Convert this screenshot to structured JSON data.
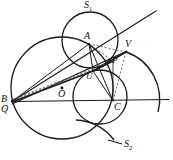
{
  "figure": {
    "kind": "geometry-diagram",
    "width": 173,
    "height": 160,
    "background": "#ffffff",
    "stroke_color": "#1a1a1a",
    "dashed_color": "#555555"
  },
  "labels": {
    "s1": "S",
    "s1_sub": "1",
    "s2": "S",
    "s2_sub": "2",
    "a": "A",
    "b": "B",
    "c": "C",
    "o": "O",
    "p": "P",
    "q": "Q",
    "u": "U",
    "v": "V"
  },
  "points": {
    "A": {
      "x": 89,
      "y": 44,
      "label": "A",
      "label_x": 84,
      "label_y": 33
    },
    "B": {
      "x": 12,
      "y": 101,
      "label": "B",
      "label_x": 2,
      "label_y": 95
    },
    "C": {
      "x": 113,
      "y": 101,
      "label": "C",
      "label_x": 115,
      "label_y": 104
    },
    "O": {
      "x": 62,
      "y": 88,
      "label": "O",
      "label_x": 60,
      "label_y": 91
    },
    "P": {
      "x": 113,
      "y": 61,
      "label": "P",
      "label_x": 111,
      "label_y": 58
    },
    "Q": {
      "x": 12,
      "y": 104,
      "label": "Q",
      "label_x": 2,
      "label_y": 106
    },
    "U": {
      "x": 93,
      "y": 71,
      "label": "U",
      "label_x": 88,
      "label_y": 74
    },
    "V": {
      "x": 126,
      "y": 52,
      "label": "V",
      "label_x": 125,
      "label_y": 41
    },
    "S1": {
      "label_x": 85,
      "label_y": 1
    },
    "S2": {
      "label_x": 126,
      "label_y": 140
    }
  },
  "circles": [
    {
      "name": "large-circle-O",
      "cx": 62,
      "cy": 88,
      "r": 51
    },
    {
      "name": "circle-S1",
      "cx": 90,
      "cy": 40,
      "r": 28
    },
    {
      "name": "circle-lower",
      "cx": 100,
      "cy": 97,
      "r": 27
    }
  ],
  "arcs": [
    {
      "name": "arc-S2-right",
      "d": "M 126,52 A 48,48 0 0 1 160,113"
    },
    {
      "name": "arc-S2-bottom",
      "d": "M 123,139 A 48,48 0 0 0 78,119"
    }
  ],
  "lines": [
    {
      "name": "horizontal-line-BC",
      "x1": 12,
      "y1": 101,
      "x2": 169,
      "y2": 99
    },
    {
      "name": "diagonal-line-BV",
      "x1": 12,
      "y1": 101,
      "x2": 156,
      "y2": 11
    },
    {
      "name": "segment-A-U",
      "x1": 89,
      "y1": 44,
      "x2": 93,
      "y2": 71
    },
    {
      "name": "segment-A-C",
      "x1": 89,
      "y1": 44,
      "x2": 113,
      "y2": 101
    },
    {
      "name": "segment-U-C",
      "x1": 93,
      "y1": 71,
      "x2": 113,
      "y2": 101
    },
    {
      "name": "segment-U-V",
      "x1": 93,
      "y1": 71,
      "x2": 126,
      "y2": 52
    },
    {
      "name": "segment-B-U",
      "x1": 12,
      "y1": 101,
      "x2": 93,
      "y2": 71
    },
    {
      "name": "segment-B-A",
      "x1": 12,
      "y1": 101,
      "x2": 89,
      "y2": 44
    },
    {
      "name": "segment-Q-V",
      "x1": 12,
      "y1": 104,
      "x2": 126,
      "y2": 52
    }
  ],
  "dashed_lines": [
    {
      "name": "dashed-A-V",
      "x1": 89,
      "y1": 44,
      "x2": 126,
      "y2": 52
    },
    {
      "name": "dashed-A-P",
      "x1": 89,
      "y1": 44,
      "x2": 113,
      "y2": 61
    },
    {
      "name": "dashed-V-C",
      "x1": 126,
      "y1": 52,
      "x2": 113,
      "y2": 101
    },
    {
      "name": "dashed-B-P",
      "x1": 12,
      "y1": 102,
      "x2": 113,
      "y2": 61
    },
    {
      "name": "dashed-B-O",
      "x1": 12,
      "y1": 102,
      "x2": 62,
      "y2": 88
    }
  ],
  "leaders": [
    {
      "name": "leader-S1",
      "x1": 90,
      "y1": 12,
      "x2": 93,
      "y2": 12
    },
    {
      "name": "leader-S2",
      "x1": 113,
      "y1": 140,
      "x2": 124,
      "y2": 144
    }
  ]
}
